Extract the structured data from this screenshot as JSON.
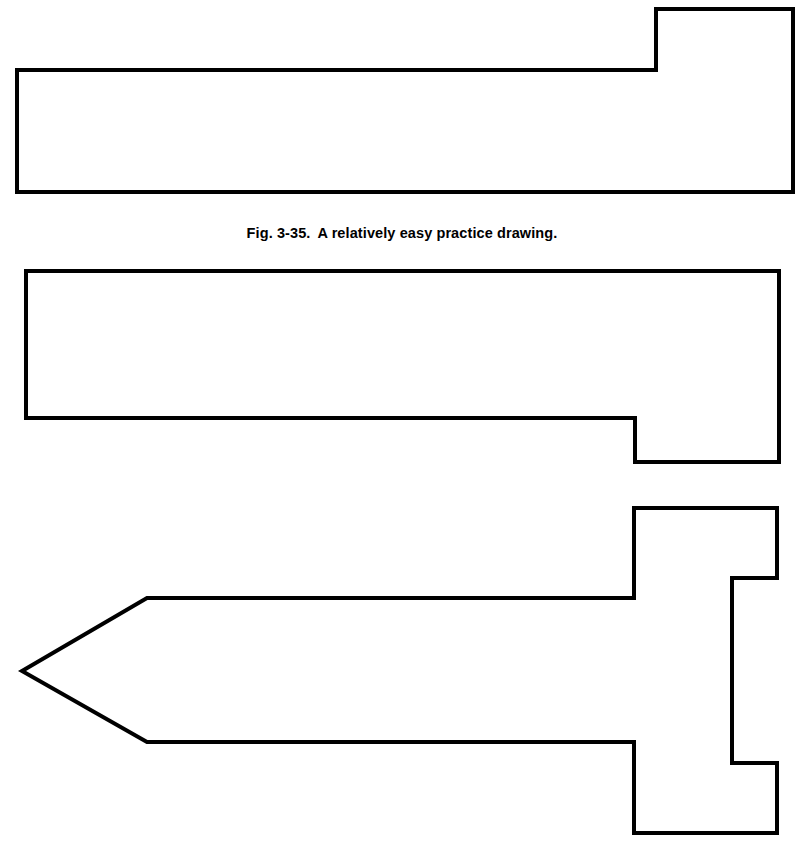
{
  "page": {
    "background_color": "#ffffff",
    "ink_color": "#000000",
    "width": 804,
    "height": 861,
    "kind": "technical-drawing-practice-page"
  },
  "figures": [
    {
      "id": "figure-1",
      "name": "notched-bar-step-up-right",
      "description": "Long horizontal rectangular bar with a raised rectangular step at the right end",
      "stroke_color": "#000000",
      "stroke_width": 4,
      "points": "17,70 656,70 656,9 793,9 793,192 17,192",
      "closed": true
    },
    {
      "id": "figure-2",
      "name": "notched-bar-step-down-right",
      "description": "Long horizontal rectangular bar with a dropped rectangular step at the right end",
      "stroke_color": "#000000",
      "stroke_width": 4,
      "points": "26,271 779,271 779,462 635,462 635,418 26,418",
      "closed": true
    },
    {
      "id": "figure-3",
      "name": "arrow-sword-outline",
      "description": "Symmetric arrow or sword shaped outline: pointed tip at left, long shaft, and a stepped blocky head at the right",
      "stroke_color": "#000000",
      "stroke_width": 4,
      "points": "22,671 147,598 634,598 634,508 777,508 777,578 732,578 732,763 777,763 777,833 634,833 634,742 147,742",
      "closed": true
    }
  ],
  "captions": [
    {
      "id": "caption-fig-3-35",
      "label": "Fig. 3-35.",
      "text": "A relatively easy practice drawing.",
      "for_figure": "figure-1"
    }
  ]
}
